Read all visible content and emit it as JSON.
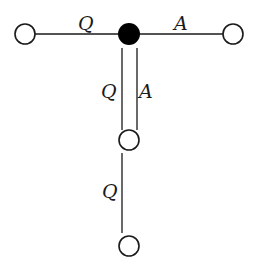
{
  "diagram": {
    "colors": {
      "stroke": "#1a1a1a",
      "filled_node": "#000000",
      "open_node_fill": "#ffffff",
      "background": "#ffffff"
    },
    "nodes": [
      {
        "id": "left",
        "type": "open",
        "cx": 25,
        "cy": 34,
        "r": 10
      },
      {
        "id": "center",
        "type": "filled",
        "cx": 129,
        "cy": 34,
        "r": 11
      },
      {
        "id": "right",
        "type": "open",
        "cx": 233,
        "cy": 34,
        "r": 10
      },
      {
        "id": "middle",
        "type": "open",
        "cx": 129,
        "cy": 140,
        "r": 10
      },
      {
        "id": "bottom",
        "type": "open",
        "cx": 129,
        "cy": 246,
        "r": 10
      }
    ],
    "edges": [
      {
        "from": "left",
        "to": "center",
        "label": "Q"
      },
      {
        "from": "center",
        "to": "right",
        "label": "A"
      },
      {
        "from": "center",
        "to": "middle",
        "label": "Q",
        "parallel": true
      },
      {
        "from": "center",
        "to": "middle",
        "label": "A",
        "parallel": true
      },
      {
        "from": "middle",
        "to": "bottom",
        "label": "Q"
      }
    ],
    "labels": {
      "left_edge": "Q",
      "right_edge": "A",
      "vertical_left": "Q",
      "vertical_right": "A",
      "lower_edge": "Q"
    }
  }
}
